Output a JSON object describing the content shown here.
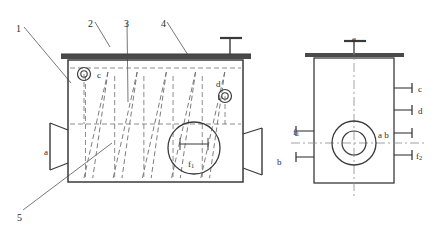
{
  "drawing": {
    "title": "Two-view engineering drawing of a coil heat exchanger vessel",
    "line_color": "#3a3a3a",
    "hidden_line_color": "#6e6e6e",
    "center_line_color": "#8a8a8a",
    "leader_color": "#555555",
    "background": "#ffffff"
  },
  "part_callouts": [
    {
      "id": "1",
      "x": 16,
      "y": 24,
      "leader": {
        "x1": 24,
        "y1": 27,
        "x2": 71,
        "y2": 83
      }
    },
    {
      "id": "2",
      "x": 88,
      "y": 19,
      "leader": {
        "x1": 95,
        "y1": 22,
        "x2": 110,
        "y2": 47
      }
    },
    {
      "id": "3",
      "x": 124,
      "y": 19,
      "leader": {
        "x1": 127,
        "y1": 22,
        "x2": 128,
        "y2": 102
      }
    },
    {
      "id": "4",
      "x": 161,
      "y": 19,
      "leader": {
        "x1": 167,
        "y1": 22,
        "x2": 188,
        "y2": 55
      }
    },
    {
      "id": "5",
      "x": 17,
      "y": 213,
      "leader": {
        "x1": 23,
        "y1": 210,
        "x2": 112,
        "y2": 143
      }
    }
  ],
  "front_view": {
    "name": "front-elevation",
    "body": {
      "x": 68,
      "y": 60,
      "width": 175,
      "height": 122
    },
    "top_plate": {
      "x": 61,
      "y": 54,
      "width": 190,
      "height": 5
    },
    "top_nozzle": {
      "stem_x": 230,
      "stem_top": 38,
      "cap_x1": 220,
      "cap_x2": 242,
      "cap_y": 38
    },
    "nozzles": [
      {
        "label": "c",
        "cx": 84,
        "cy": 74,
        "r_outer": 6.5,
        "r_inner": 3.2,
        "label_x": 97,
        "label_y": 71
      },
      {
        "label": "d",
        "cx": 225,
        "cy": 96,
        "r_outer": 6.5,
        "r_inner": 3.2,
        "label_x": 216,
        "label_y": 80
      }
    ],
    "side_flanges": [
      {
        "label": "a",
        "side": "left",
        "label_x": 44,
        "label_y": 148,
        "flange_x": 50,
        "y_top": 123,
        "y_bottom": 170,
        "taper_x": 68,
        "taper_top": 130,
        "taper_bottom": 163
      },
      {
        "label": "b",
        "side": "right",
        "label_x": 277,
        "label_y": 158,
        "flange_x": 262,
        "y_top": 128,
        "y_bottom": 175,
        "taper_x": 243,
        "taper_top": 134,
        "taper_bottom": 168
      }
    ],
    "detail_circle": {
      "label": "f",
      "sub": "1",
      "cx": 194,
      "cy": 148,
      "r": 26,
      "label_x": 188,
      "label_y": 160
    },
    "coil": {
      "description": "internal helical coil shown as hidden zigzag lines",
      "top_y": 72,
      "bottom_y": 178,
      "peaks": 5,
      "x_start": 84,
      "x_end": 230
    },
    "hidden_horizontals": [
      {
        "x1": 70,
        "x2": 241,
        "y": 68
      },
      {
        "x1": 70,
        "x2": 241,
        "y": 124
      }
    ]
  },
  "side_view": {
    "name": "side-elevation",
    "body": {
      "x": 314,
      "y": 58,
      "width": 80,
      "height": 125
    },
    "top_plate": {
      "x": 305,
      "y": 53,
      "width": 99,
      "height": 4
    },
    "top_nozzle": {
      "label": "e",
      "label_x": 352,
      "label_y": 35,
      "stem_x": 354,
      "stem_top": 41,
      "cap_x1": 344,
      "cap_x2": 366,
      "cap_y": 41
    },
    "center_circles": {
      "cx": 354,
      "cy": 143,
      "r_outer": 22,
      "r_inner": 12,
      "label": "a b",
      "label_x": 378,
      "label_y": 131
    },
    "vertical_centerline": {
      "x": 354,
      "y1": 46,
      "y2": 196
    },
    "horizontal_centerline": {
      "y": 143,
      "x1": 291,
      "x2": 424
    },
    "right_nozzles": [
      {
        "label": "c",
        "y": 88,
        "label_x": 418,
        "label_y": 85
      },
      {
        "label": "d",
        "y": 110,
        "label_x": 418,
        "label_y": 107
      },
      {
        "label": "",
        "y": 133,
        "label_x": 418,
        "label_y": 130
      },
      {
        "label": "f",
        "sub": "2",
        "y": 155,
        "label_x": 416,
        "label_y": 152
      }
    ],
    "left_nozzles": [
      {
        "label": "f",
        "sub": "1",
        "y": 131,
        "label_x": 293,
        "label_y": 128
      },
      {
        "label": "",
        "y": 157,
        "label_x": 293,
        "label_y": 154
      }
    ]
  },
  "reference_letters": [
    "a",
    "b",
    "c",
    "d",
    "e",
    "f1",
    "f2"
  ]
}
